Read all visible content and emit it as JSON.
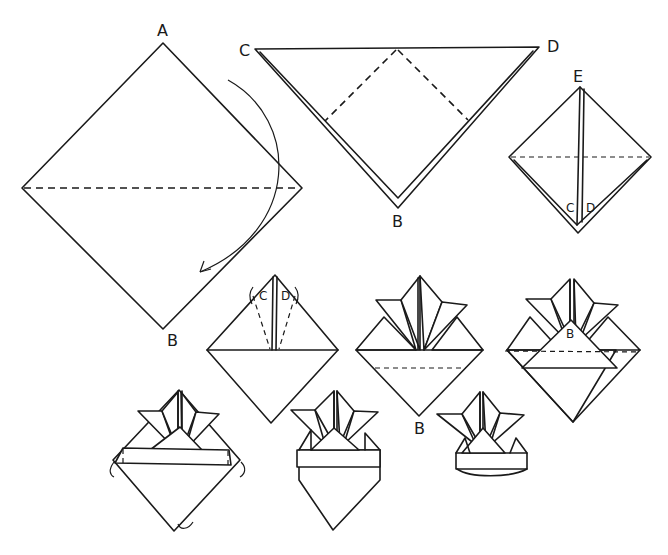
{
  "diagram": {
    "steps": [
      {
        "id": 1,
        "description": "Square turned as diamond; fold top corner A down to B along horizontal dashed line"
      },
      {
        "id": 2,
        "description": "Triangle with corners C, D at top and B at bottom; fold C and D down along dashed lines"
      },
      {
        "id": 3,
        "description": "Diamond with flaps C and D meeting at top point E; fold top down along horizontal dashed line"
      },
      {
        "id": 4,
        "description": "Fold flaps C and D back up and outward along dashed lines"
      },
      {
        "id": 5,
        "description": "Horns formed; fold bottom point B up along dashed line"
      },
      {
        "id": 6,
        "description": "Front flap B folded up; fold along dashed line"
      },
      {
        "id": 7,
        "description": "Brim band formed; fold side corners and bottom point behind"
      },
      {
        "id": 8,
        "description": "Helmet shape with band"
      },
      {
        "id": 9,
        "description": "Finished helmet opened at base"
      }
    ],
    "labels": {
      "step1_top": "A",
      "step1_bottom": "B",
      "step2_left": "C",
      "step2_right": "D",
      "step2_bottom": "B",
      "step3_top": "E",
      "step3_left_flap": "C",
      "step3_right_flap": "D",
      "step4_left_flap": "C",
      "step4_right_flap": "D",
      "step5_bottom": "B",
      "step6_flap": "B"
    }
  }
}
